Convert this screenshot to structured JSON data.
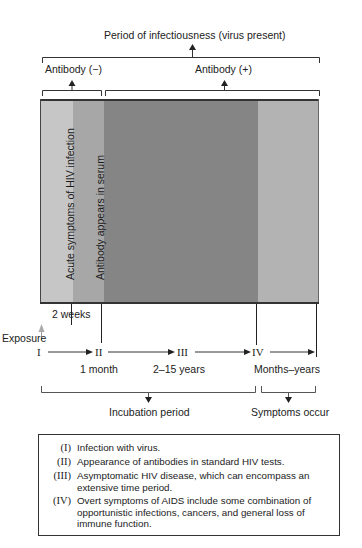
{
  "diagram": {
    "title": "Period of infectiousness (virus present)",
    "antibody_negative": "Antibody (−)",
    "antibody_positive": "Antibody (+)",
    "vertical_labels": {
      "acute": "Acute symptoms of HIV infection",
      "antibody_serum": "Antibody appears in serum"
    },
    "time_labels": {
      "two_weeks": "2 weeks",
      "exposure": "Exposure",
      "one_month": "1 month",
      "years": "2–15 years",
      "months_years": "Months–years"
    },
    "stages": [
      "I",
      "II",
      "III",
      "IV"
    ],
    "brackets": {
      "incubation": "Incubation period",
      "symptoms": "Symptoms occur"
    },
    "colors": {
      "band_acute": "#c6c6c6",
      "band_antibody": "#a7a7a7",
      "band_asymptomatic": "#858585",
      "band_aids": "#b3b3b3",
      "line": "#333333"
    }
  },
  "legend": {
    "items": [
      {
        "num": "(I)",
        "text": "Infection with virus."
      },
      {
        "num": "(II)",
        "text": "Appearance of antibodies in standard HIV tests."
      },
      {
        "num": "(III)",
        "text": "Asymptomatic HIV disease, which can encompass an extensive time period."
      },
      {
        "num": "(IV)",
        "text": "Overt symptoms of AIDS include some combination of opportunistic infections, cancers, and general loss of immune function."
      }
    ]
  }
}
